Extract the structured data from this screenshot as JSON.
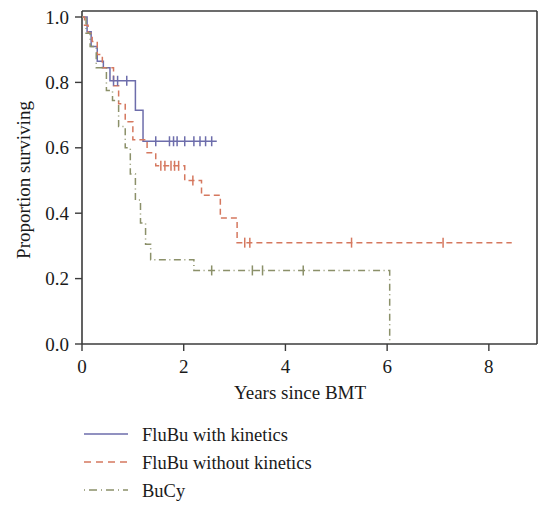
{
  "chart_data": {
    "type": "line",
    "title": "",
    "xlabel": "Years since BMT",
    "ylabel": "Proportion surviving",
    "xlim": [
      0,
      8.75
    ],
    "ylim": [
      0,
      1.04
    ],
    "grid": false,
    "legend_position": "bottom-left",
    "xticks": [
      0,
      2,
      4,
      6,
      8
    ],
    "xtick_labels": [
      "0",
      "2",
      "4",
      "6",
      "8"
    ],
    "yticks": [
      0.0,
      0.2,
      0.4,
      0.6,
      0.8,
      1.0
    ],
    "ytick_labels": [
      "0.0",
      "0.2",
      "0.4",
      "0.6",
      "0.8",
      "1.0"
    ],
    "series": [
      {
        "name": "FluBu with kinetics",
        "color": "#6d6dab",
        "dash": "solid",
        "legend_dash_pattern": "none",
        "steps": [
          [
            0.0,
            1.0
          ],
          [
            0.1,
            1.0
          ],
          [
            0.1,
            0.955
          ],
          [
            0.18,
            0.955
          ],
          [
            0.18,
            0.91
          ],
          [
            0.3,
            0.91
          ],
          [
            0.3,
            0.865
          ],
          [
            0.42,
            0.865
          ],
          [
            0.42,
            0.845
          ],
          [
            0.55,
            0.845
          ],
          [
            0.55,
            0.805
          ],
          [
            1.05,
            0.805
          ],
          [
            1.05,
            0.715
          ],
          [
            1.2,
            0.715
          ],
          [
            1.2,
            0.62
          ],
          [
            2.65,
            0.62
          ]
        ],
        "censor_marks": [
          [
            0.62,
            0.805
          ],
          [
            0.7,
            0.805
          ],
          [
            0.88,
            0.805
          ],
          [
            1.45,
            0.62
          ],
          [
            1.72,
            0.62
          ],
          [
            1.8,
            0.62
          ],
          [
            1.87,
            0.62
          ],
          [
            2.02,
            0.62
          ],
          [
            2.2,
            0.62
          ],
          [
            2.32,
            0.62
          ],
          [
            2.43,
            0.62
          ],
          [
            2.55,
            0.62
          ]
        ]
      },
      {
        "name": "FluBu without kinetics",
        "color": "#d5785f",
        "dash": "dashed",
        "legend_dash_pattern": "7,5",
        "steps": [
          [
            0.0,
            1.0
          ],
          [
            0.05,
            1.0
          ],
          [
            0.05,
            0.975
          ],
          [
            0.12,
            0.975
          ],
          [
            0.12,
            0.95
          ],
          [
            0.2,
            0.95
          ],
          [
            0.2,
            0.925
          ],
          [
            0.3,
            0.925
          ],
          [
            0.3,
            0.885
          ],
          [
            0.4,
            0.885
          ],
          [
            0.4,
            0.845
          ],
          [
            0.62,
            0.845
          ],
          [
            0.62,
            0.79
          ],
          [
            0.72,
            0.79
          ],
          [
            0.72,
            0.735
          ],
          [
            0.85,
            0.735
          ],
          [
            0.85,
            0.68
          ],
          [
            1.0,
            0.68
          ],
          [
            1.0,
            0.625
          ],
          [
            1.28,
            0.625
          ],
          [
            1.28,
            0.585
          ],
          [
            1.45,
            0.585
          ],
          [
            1.45,
            0.545
          ],
          [
            2.02,
            0.545
          ],
          [
            2.02,
            0.5
          ],
          [
            2.35,
            0.5
          ],
          [
            2.35,
            0.455
          ],
          [
            2.72,
            0.455
          ],
          [
            2.72,
            0.385
          ],
          [
            3.05,
            0.385
          ],
          [
            3.05,
            0.31
          ],
          [
            8.45,
            0.31
          ]
        ],
        "censor_marks": [
          [
            1.55,
            0.545
          ],
          [
            1.63,
            0.545
          ],
          [
            1.75,
            0.545
          ],
          [
            1.82,
            0.545
          ],
          [
            1.9,
            0.545
          ],
          [
            2.18,
            0.5
          ],
          [
            3.2,
            0.31
          ],
          [
            3.3,
            0.31
          ],
          [
            5.3,
            0.31
          ],
          [
            7.1,
            0.31
          ]
        ]
      },
      {
        "name": "BuCy",
        "color": "#8b9069",
        "dash": "dashdot",
        "legend_dash_pattern": "1,4,8,4",
        "steps": [
          [
            0.0,
            1.0
          ],
          [
            0.08,
            1.0
          ],
          [
            0.08,
            0.95
          ],
          [
            0.16,
            0.95
          ],
          [
            0.16,
            0.91
          ],
          [
            0.28,
            0.91
          ],
          [
            0.28,
            0.845
          ],
          [
            0.48,
            0.845
          ],
          [
            0.48,
            0.775
          ],
          [
            0.6,
            0.775
          ],
          [
            0.6,
            0.745
          ],
          [
            0.72,
            0.745
          ],
          [
            0.72,
            0.665
          ],
          [
            0.85,
            0.665
          ],
          [
            0.85,
            0.6
          ],
          [
            0.95,
            0.6
          ],
          [
            0.95,
            0.52
          ],
          [
            1.05,
            0.52
          ],
          [
            1.05,
            0.44
          ],
          [
            1.15,
            0.44
          ],
          [
            1.15,
            0.37
          ],
          [
            1.25,
            0.37
          ],
          [
            1.25,
            0.305
          ],
          [
            1.35,
            0.305
          ],
          [
            1.35,
            0.258
          ],
          [
            2.2,
            0.258
          ],
          [
            2.2,
            0.225
          ],
          [
            6.05,
            0.225
          ],
          [
            6.05,
            0.0
          ]
        ],
        "censor_marks": [
          [
            2.55,
            0.225
          ],
          [
            3.35,
            0.225
          ],
          [
            3.55,
            0.225
          ],
          [
            4.35,
            0.225
          ]
        ]
      }
    ]
  },
  "legend": {
    "items": [
      {
        "label": "FluBu with kinetics"
      },
      {
        "label": "FluBu without kinetics"
      },
      {
        "label": "BuCy"
      }
    ]
  }
}
